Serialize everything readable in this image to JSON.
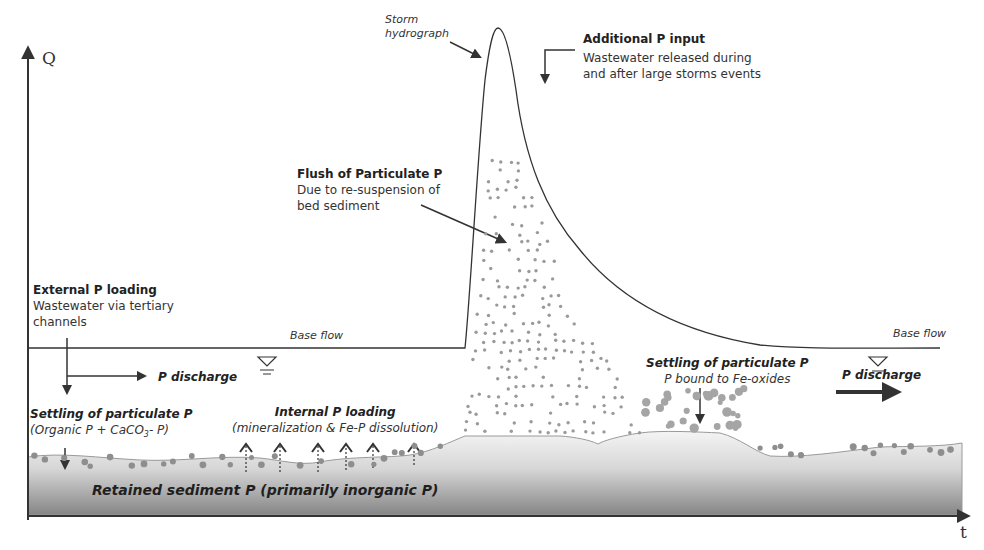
{
  "axes": {
    "y_label": "Q",
    "x_label": "t"
  },
  "labels": {
    "storm_hydrograph": [
      "Storm",
      "hydrograph"
    ],
    "additional_input": {
      "title": "Additional P input",
      "lines": [
        "Wastewater released during",
        "and after large storms events"
      ]
    },
    "flush": {
      "title": "Flush of Particulate P",
      "lines": [
        "Due to re-suspension of",
        "bed sediment"
      ]
    },
    "external_loading": {
      "title": "External P loading",
      "lines": [
        "Wastewater via tertiary",
        "channels"
      ]
    },
    "base_flow_left": "Base flow",
    "base_flow_right": "Base flow",
    "p_discharge_left": "P discharge",
    "p_discharge_right": "P discharge",
    "settling_left": {
      "title": "Settling of particulate P",
      "sub": "(Organic P + CaCO",
      "sub_subscript": "3",
      "sub_end": "- P)"
    },
    "internal_loading": {
      "title": "Internal P loading",
      "sub": "(mineralization & Fe-P dissolution)"
    },
    "settling_right": {
      "title": "Settling of particulate P",
      "sub": "P bound to Fe-oxides"
    },
    "retained_sediment": "Retained sediment P (primarily inorganic P)"
  },
  "colors": {
    "line": "#3a3a3a",
    "dots": "#9a9a9a",
    "sediment_top": "#f2f2f2",
    "sediment_bottom": "#8c8c8c"
  }
}
